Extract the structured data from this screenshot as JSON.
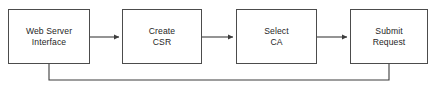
{
  "diagram": {
    "type": "flowchart",
    "orientation": "horizontal",
    "canvas": {
      "width": 434,
      "height": 91
    },
    "background_color": "#ffffff",
    "border_color": "#4c4c4c",
    "line_color": "#3c3c3c",
    "text_color": "#262626",
    "nodes": [
      {
        "id": "web-server-interface",
        "line1": "Web Server",
        "line2": "Interface",
        "x": 8,
        "y": 9,
        "width": 82,
        "height": 55
      },
      {
        "id": "create-csr",
        "line1": "Create",
        "line2": "CSR",
        "x": 122,
        "y": 9,
        "width": 80,
        "height": 55
      },
      {
        "id": "select-ca",
        "line1": "Select",
        "line2": "CA",
        "x": 236,
        "y": 9,
        "width": 81,
        "height": 55
      },
      {
        "id": "submit-request",
        "line1": "Submit",
        "line2": "Request",
        "x": 350,
        "y": 9,
        "width": 78,
        "height": 55
      }
    ],
    "connectors": [
      {
        "id": "arrow-interface-to-create",
        "from": "web-server-interface",
        "to": "create-csr",
        "kind": "arrow",
        "path": "M 90 37 L 119 37",
        "arrowhead": true
      },
      {
        "id": "arrow-create-to-select",
        "from": "create-csr",
        "to": "select-ca",
        "kind": "arrow",
        "path": "M 202 37 L 233 37",
        "arrowhead": true
      },
      {
        "id": "arrow-select-to-submit",
        "from": "select-ca",
        "to": "submit-request",
        "kind": "arrow",
        "path": "M 317 37 L 347 37",
        "arrowhead": true
      },
      {
        "id": "feedback-submit-to-interface",
        "from": "submit-request",
        "to": "web-server-interface",
        "kind": "feedback-loop",
        "path": "M 389 64 L 389 80 L 49 80 L 49 64",
        "arrowhead": false
      }
    ]
  }
}
